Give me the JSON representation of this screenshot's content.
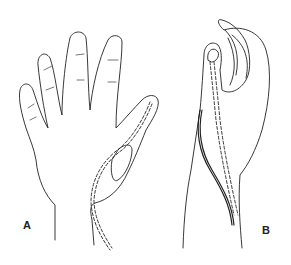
{
  "figure": {
    "panels": [
      {
        "id": "A",
        "label": "A",
        "description": "Palmar view of open hand with dashed tendon/implant path along thumb and wrist"
      },
      {
        "id": "B",
        "label": "B",
        "description": "Lateral view of hand with thumb flexed, showing tendon paths along thumb and forearm"
      }
    ],
    "colors": {
      "line": "#222222",
      "background": "#ffffff"
    }
  }
}
